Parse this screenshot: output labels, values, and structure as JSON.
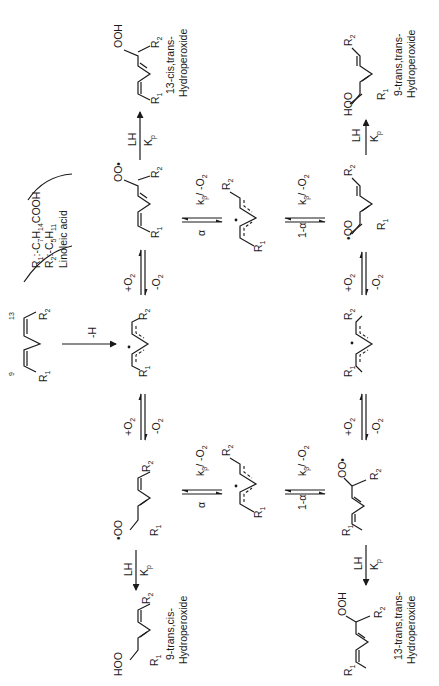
{
  "diagram": {
    "orientation": "rotated 90 degrees counter-clockwise",
    "legend": {
      "r1": "R1: -C7H14COOH",
      "r1_parts": {
        "main": "R",
        "sub1": "1",
        "rest": ":-C",
        "s7": "7",
        "h": "H",
        "s14": "14",
        "tail": "COOH"
      },
      "r2": "R2: -C5H11",
      "r2_parts": {
        "main": "R",
        "sub2": "2",
        "rest": ":-C",
        "s5": "5",
        "h": "H",
        "s11": "11"
      },
      "name": "Linoleic acid"
    },
    "start": {
      "label": "Linoleic acid",
      "positions": {
        "left": "9",
        "right": "13"
      },
      "r1": "R",
      "r1_sub": "1",
      "r2": "R",
      "r2_sub": "2"
    },
    "steps": {
      "abstraction": "-H",
      "o2_add": "+O",
      "o2_add_sub": "2",
      "o2_remove": "-O",
      "o2_remove_sub": "2",
      "alpha": "α",
      "one_minus_alpha": "1-α",
      "k_beta": "k",
      "k_beta_sub": "β",
      "k_beta_tail": "/ -O",
      "k_beta_tail_sub": "2",
      "lh": "LH",
      "kp": "K",
      "kp_sub": "p"
    },
    "intermediates": {
      "peroxyl_13": "OO•",
      "peroxyl_9": "•OO",
      "radical": "•"
    },
    "products": [
      {
        "id": "13-cis-trans",
        "line1": "13-cis,trans-",
        "line2": "Hydroperoxide",
        "group": "OOH"
      },
      {
        "id": "9-trans-trans",
        "line1": "9-trans,trans-",
        "line2": "Hydroperoxide",
        "group": "HOO"
      },
      {
        "id": "9-trans-cis",
        "line1": "9-trans,cis-",
        "line2": "Hydroperoxide",
        "group": "HOO"
      },
      {
        "id": "13-trans-trans",
        "line1": "13-trans,trans-",
        "line2": "Hydroperoxide",
        "group": "OOH"
      }
    ],
    "r_labels": {
      "r": "R",
      "one": "1",
      "two": "2"
    }
  }
}
